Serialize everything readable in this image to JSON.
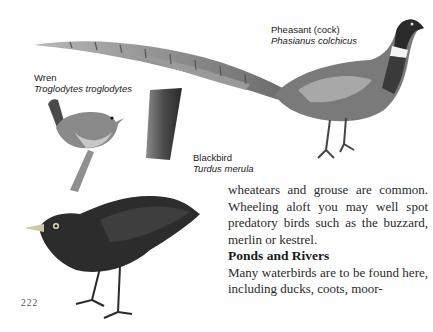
{
  "captions": {
    "pheasant": {
      "common": "Pheasant (cock)",
      "latin": "Phasianus colchicus"
    },
    "wren": {
      "common": "Wren",
      "latin": "Troglodytes troglodytes"
    },
    "blackbird": {
      "common": "Blackbird",
      "latin": "Turdus merula"
    }
  },
  "body": {
    "para1": "wheatears and grouse are common. Wheeling aloft you may well spot predatory birds such as the buzzard, merlin or kestrel.",
    "heading": "Ponds and Rivers",
    "para2": "Many waterbirds are to be found here, including ducks, coots, moor-"
  },
  "page_number": "222",
  "illustrations": [
    "pheasant-illustration",
    "wren-illustration",
    "blackbird-illustration"
  ]
}
